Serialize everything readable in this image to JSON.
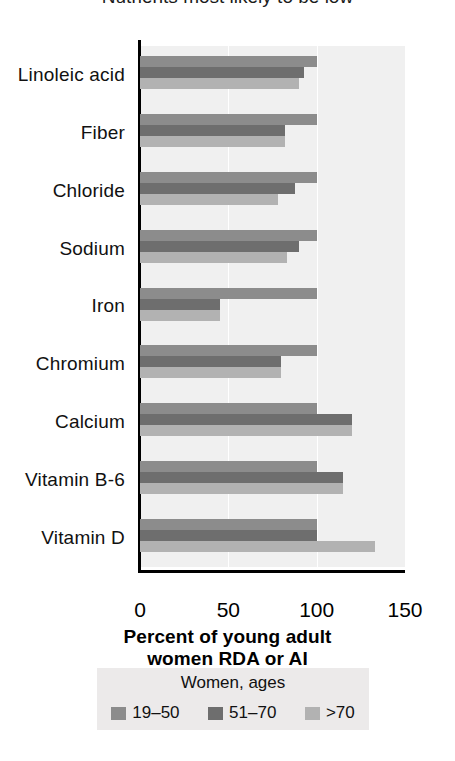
{
  "title": {
    "text": "Nutrients most likely to be low",
    "clipped": true
  },
  "chart_data": {
    "type": "bar",
    "orientation": "horizontal",
    "title": "Nutrients most likely to be low",
    "xlabel": "Percent of young adult women RDA or AI",
    "ylabel": "",
    "xlim": [
      0,
      150
    ],
    "xticks": [
      0,
      50,
      100,
      150
    ],
    "grid": true,
    "legend_position": "bottom",
    "legend_title": "Women, ages",
    "categories": [
      "Linoleic acid",
      "Fiber",
      "Chloride",
      "Sodium",
      "Iron",
      "Chromium",
      "Calcium",
      "Vitamin B-6",
      "Vitamin D"
    ],
    "series": [
      {
        "name": "19–50",
        "color": "#8c8c8c",
        "values": [
          100,
          100,
          100,
          100,
          100,
          100,
          100,
          100,
          100
        ]
      },
      {
        "name": "51–70",
        "color": "#6e6e6e",
        "values": [
          93,
          82,
          88,
          90,
          45,
          80,
          120,
          115,
          100
        ]
      },
      {
        "name": ">70",
        "color": "#b2b2b2",
        "values": [
          90,
          82,
          78,
          83,
          45,
          80,
          120,
          115,
          133
        ]
      }
    ]
  },
  "axis": {
    "tick_labels": [
      "0",
      "50",
      "100",
      "150"
    ],
    "x_title_line1": "Percent of young adult",
    "x_title_line2": "women RDA or AI"
  },
  "legend": {
    "title": "Women, ages",
    "items": [
      {
        "label": "19–50",
        "color": "#8c8c8c"
      },
      {
        "label": "51–70",
        "color": "#6e6e6e"
      },
      {
        "label": ">70",
        "color": "#b2b2b2"
      }
    ]
  },
  "colors": {
    "plot_background": "#f0f0f0",
    "gridline": "#ffffff",
    "axis": "#000000",
    "legend_background": "#eceaea",
    "page_background": "#ffffff"
  }
}
